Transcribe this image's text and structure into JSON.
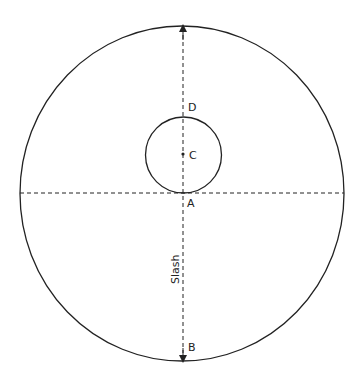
{
  "diagram": {
    "colors": {
      "stroke": "#222222",
      "background": "#ffffff"
    },
    "outer_circle": {
      "cx": 182,
      "cy": 193.5,
      "rx": 162,
      "ry": 167.5
    },
    "inner_circle": {
      "cx": 183.5,
      "cy": 155,
      "r": 38
    },
    "points": {
      "A": {
        "label": "A"
      },
      "B": {
        "label": "B"
      },
      "C": {
        "label": "C"
      },
      "D": {
        "label": "D"
      }
    },
    "slash_label": "Slash"
  }
}
